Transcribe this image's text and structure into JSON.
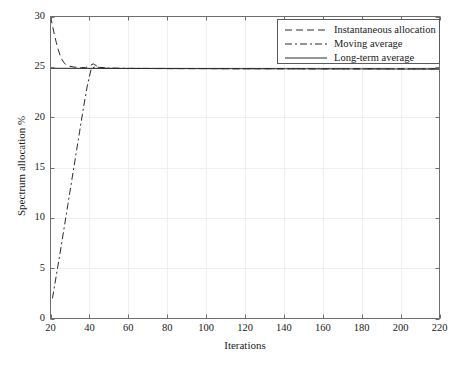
{
  "chart_data": {
    "type": "line",
    "title": "",
    "xlabel": "Iterations",
    "ylabel": "Spectrum allocation %",
    "xlim": [
      20,
      220
    ],
    "ylim": [
      0,
      30
    ],
    "xticks": [
      20,
      40,
      60,
      80,
      100,
      120,
      140,
      160,
      180,
      200,
      220
    ],
    "yticks": [
      0,
      5,
      10,
      15,
      20,
      25,
      30
    ],
    "grid": true,
    "legend_position": "top-right",
    "series": [
      {
        "name": "Instantaneous allocation",
        "style": "dashed",
        "color": "#2b2b2b",
        "x": [
          20,
          21,
          22,
          23,
          24,
          25,
          26,
          27,
          28,
          30,
          32,
          34,
          36,
          38,
          40,
          42,
          44,
          46,
          48,
          50,
          55,
          60,
          70,
          80,
          90,
          100,
          110,
          120,
          130,
          140,
          150,
          160,
          170,
          180,
          190,
          200,
          210,
          220
        ],
        "values": [
          30.0,
          29.1,
          28.2,
          27.4,
          26.7,
          26.1,
          25.7,
          25.4,
          25.2,
          25.05,
          24.98,
          24.95,
          24.93,
          24.92,
          25.1,
          25.3,
          25.05,
          24.9,
          24.86,
          24.85,
          24.84,
          24.83,
          24.83,
          24.82,
          24.82,
          24.82,
          24.81,
          24.81,
          24.81,
          24.81,
          24.8,
          24.8,
          24.8,
          24.8,
          24.8,
          24.8,
          24.8,
          24.8
        ]
      },
      {
        "name": "Moving average",
        "style": "dashdot",
        "color": "#2b2b2b",
        "x": [
          21,
          23,
          25,
          27,
          29,
          31,
          33,
          35,
          37,
          39,
          41,
          43,
          45,
          50,
          60,
          80,
          100,
          120,
          140,
          160,
          180,
          200,
          220
        ],
        "values": [
          2.0,
          4.3,
          6.6,
          9.0,
          11.4,
          13.8,
          16.2,
          18.6,
          21.0,
          23.2,
          24.85,
          25.0,
          24.95,
          24.88,
          24.85,
          24.84,
          24.83,
          24.82,
          24.82,
          24.81,
          24.81,
          24.8,
          24.8
        ]
      },
      {
        "name": "Long-term average",
        "style": "solid",
        "color": "#2b2b2b",
        "x": [
          20,
          220
        ],
        "values": [
          24.85,
          24.78
        ]
      }
    ],
    "legend": [
      {
        "label": "Instantaneous allocation",
        "style": "dashed"
      },
      {
        "label": "Moving average",
        "style": "dashdot"
      },
      {
        "label": "Long-term average",
        "style": "solid"
      }
    ],
    "axis_color": "#6e6e6e",
    "grid_color": "#efefef",
    "background": "#ffffff"
  }
}
